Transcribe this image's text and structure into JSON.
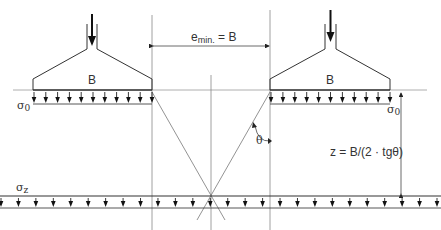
{
  "diagram": {
    "colors": {
      "line": "#333333",
      "thin_line": "#888888",
      "text": "#333333"
    },
    "labels": {
      "footing_width_left": "B",
      "footing_width_right": "B",
      "spacing_symbol": "e",
      "spacing_subscript": "min.",
      "spacing_eq": "= B",
      "sigma0_left": "σ",
      "sigma0_left_sub": "0",
      "sigma0_right": "σ",
      "sigma0_right_sub": "0",
      "sigmaz": "σ",
      "sigmaz_sub": "z",
      "theta": "θ",
      "depth_formula": "z = B/(2 · tgθ)"
    },
    "elements": {
      "footings": 2,
      "load_arrows_per_footing": 11,
      "bottom_load_arrows": 26
    }
  }
}
